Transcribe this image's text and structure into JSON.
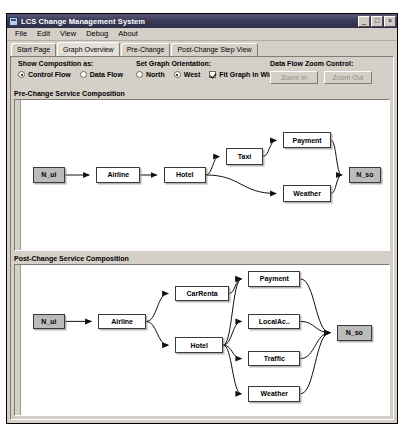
{
  "window": {
    "title": "LCS Change Management System",
    "icon": "app-icon",
    "buttons": [
      {
        "name": "minimize",
        "glyph": "_"
      },
      {
        "name": "maximize",
        "glyph": "□"
      },
      {
        "name": "close",
        "glyph": "×"
      }
    ]
  },
  "menu": {
    "items": [
      "File",
      "Edit",
      "View",
      "Debug",
      "About"
    ]
  },
  "tabs": [
    {
      "label": "Start Page",
      "selected": false
    },
    {
      "label": "Graph Overview",
      "selected": true
    },
    {
      "label": "Pre-Change",
      "selected": false
    },
    {
      "label": "Post-Change Step View",
      "selected": false
    }
  ],
  "controls": {
    "composition": {
      "label": "Show Composition as:",
      "options": [
        {
          "label": "Control Flow",
          "selected": true
        },
        {
          "label": "Data Flow",
          "selected": false
        }
      ]
    },
    "orientation": {
      "label": "Set Graph Orientation:",
      "options": [
        {
          "label": "North",
          "selected": false
        },
        {
          "label": "West",
          "selected": true
        }
      ],
      "fit_checkbox": {
        "label": "Fit Graph in Window",
        "checked": true
      }
    },
    "zoom": {
      "label": "Data Flow Zoom Control:",
      "zoom_in_label": "Zoom In",
      "zoom_out_label": "Zoom Out",
      "enabled": false
    }
  },
  "pre_change": {
    "title": "Pre-Change Service Composition",
    "nodes": [
      {
        "id": "pre_nui",
        "label": "N_ui",
        "terminal": true,
        "x": 12,
        "y": 58,
        "w": 34,
        "h": 14
      },
      {
        "id": "pre_airline",
        "label": "Airline",
        "terminal": false,
        "x": 78,
        "y": 58,
        "w": 46,
        "h": 14
      },
      {
        "id": "pre_hotel",
        "label": "Hotel",
        "terminal": false,
        "x": 148,
        "y": 58,
        "w": 44,
        "h": 14
      },
      {
        "id": "pre_taxi",
        "label": "Taxi",
        "terminal": false,
        "x": 213,
        "y": 42,
        "w": 38,
        "h": 14
      },
      {
        "id": "pre_payment",
        "label": "Payment",
        "terminal": false,
        "x": 272,
        "y": 28,
        "w": 50,
        "h": 14
      },
      {
        "id": "pre_weather",
        "label": "Weather",
        "terminal": false,
        "x": 272,
        "y": 74,
        "w": 50,
        "h": 14
      },
      {
        "id": "pre_nso",
        "label": "N_so",
        "terminal": true,
        "x": 340,
        "y": 58,
        "w": 34,
        "h": 14
      }
    ],
    "edges": [
      {
        "from": "pre_nui",
        "to": "pre_airline"
      },
      {
        "from": "pre_airline",
        "to": "pre_hotel"
      },
      {
        "from": "pre_hotel",
        "to": "pre_taxi"
      },
      {
        "from": "pre_hotel",
        "to": "pre_weather"
      },
      {
        "from": "pre_taxi",
        "to": "pre_payment"
      },
      {
        "from": "pre_payment",
        "to": "pre_nso"
      },
      {
        "from": "pre_weather",
        "to": "pre_nso"
      }
    ]
  },
  "post_change": {
    "title": "Post-Change Service Composition",
    "nodes": [
      {
        "id": "post_nui",
        "label": "N_ui",
        "terminal": true,
        "x": 12,
        "y": 47,
        "w": 34,
        "h": 15
      },
      {
        "id": "post_airline",
        "label": "Airline",
        "terminal": false,
        "x": 80,
        "y": 47,
        "w": 50,
        "h": 15
      },
      {
        "id": "post_carrental",
        "label": "CarRenta",
        "terminal": false,
        "x": 160,
        "y": 20,
        "w": 56,
        "h": 15
      },
      {
        "id": "post_hotel",
        "label": "Hotel",
        "terminal": false,
        "x": 160,
        "y": 70,
        "w": 50,
        "h": 15
      },
      {
        "id": "post_payment",
        "label": "Payment",
        "terminal": false,
        "x": 236,
        "y": 6,
        "w": 54,
        "h": 15
      },
      {
        "id": "post_localac",
        "label": "LocalAc..",
        "terminal": false,
        "x": 236,
        "y": 47,
        "w": 54,
        "h": 15
      },
      {
        "id": "post_traffic",
        "label": "Traffic",
        "terminal": false,
        "x": 236,
        "y": 83,
        "w": 54,
        "h": 15
      },
      {
        "id": "post_weather",
        "label": "Weather",
        "terminal": false,
        "x": 236,
        "y": 117,
        "w": 54,
        "h": 15
      },
      {
        "id": "post_nso",
        "label": "N_so",
        "terminal": true,
        "x": 328,
        "y": 58,
        "w": 36,
        "h": 15
      }
    ],
    "edges": [
      {
        "from": "post_nui",
        "to": "post_airline"
      },
      {
        "from": "post_airline",
        "to": "post_carrental"
      },
      {
        "from": "post_airline",
        "to": "post_hotel"
      },
      {
        "from": "post_carrental",
        "to": "post_payment"
      },
      {
        "from": "post_hotel",
        "to": "post_payment"
      },
      {
        "from": "post_hotel",
        "to": "post_localac"
      },
      {
        "from": "post_hotel",
        "to": "post_traffic"
      },
      {
        "from": "post_hotel",
        "to": "post_weather"
      },
      {
        "from": "post_payment",
        "to": "post_nso"
      },
      {
        "from": "post_localac",
        "to": "post_nso"
      },
      {
        "from": "post_traffic",
        "to": "post_nso"
      },
      {
        "from": "post_weather",
        "to": "post_nso"
      }
    ]
  },
  "colors": {
    "window_face": "#d4d0c8",
    "title_bar": "#3c3c5a",
    "canvas": "#ffffff",
    "terminal_node": "#bcbcbc"
  }
}
